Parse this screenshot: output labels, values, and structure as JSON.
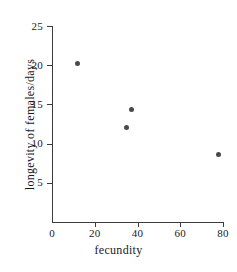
{
  "chart_data": {
    "type": "scatter",
    "title": "",
    "xlabel": "fecundity",
    "ylabel": "longevity of females/days",
    "xlim": [
      0,
      80
    ],
    "ylim": [
      0,
      25
    ],
    "grid": false,
    "legend": "none",
    "xticks": [
      0,
      20,
      40,
      60,
      80
    ],
    "xtick_labels": [
      "0",
      "20",
      "40",
      "60",
      "80"
    ],
    "yticks": [
      5,
      10,
      15,
      20,
      25
    ],
    "ytick_labels": [
      "5",
      "10",
      "15",
      "20",
      "25"
    ],
    "marker_color": "#4a4a4a",
    "axis_color": "#3c3c3c",
    "background": "#ffffff",
    "points": [
      {
        "x": 12,
        "y": 20.2
      },
      {
        "x": 35,
        "y": 12.0
      },
      {
        "x": 37,
        "y": 14.3
      },
      {
        "x": 78,
        "y": 8.6
      }
    ]
  }
}
